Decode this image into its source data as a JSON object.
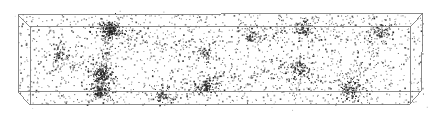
{
  "figure": {
    "title": "Cosmological simulation box particle distribution",
    "caption": "Perspective wireframe box containing scattered dark matter particles with dense clusters and filamentary structure",
    "background_color": "#ffffff",
    "width": 439,
    "height": 121
  },
  "box": {
    "name": "simulation-volume",
    "edge_color": "#6e6e6e",
    "edge_width": 0.8,
    "projection": "perspective",
    "face_fill": "none",
    "rear_face": {
      "label": "rear-face",
      "top_left": [
        18,
        15
      ],
      "top_right": [
        423,
        13
      ],
      "bottom_right": [
        421,
        91
      ],
      "bottom_left": [
        18,
        92
      ]
    },
    "front_face": {
      "label": "front-face",
      "top_left": [
        30,
        27
      ],
      "top_right": [
        411,
        26
      ],
      "bottom_right": [
        410,
        104
      ],
      "bottom_left": [
        30,
        105
      ]
    },
    "connector_edges": [
      "top-left-rear-to-front",
      "top-right-rear-to-front",
      "bottom-left-rear-to-front",
      "bottom-right-rear-to-front"
    ]
  },
  "chart_data": {
    "type": "scatter",
    "title": "",
    "xlabel": "",
    "ylabel": "",
    "xlim": [
      0,
      1
    ],
    "ylim": [
      0,
      1
    ],
    "grid": false,
    "legend": null,
    "point_count": 3400,
    "point_color": "#303030",
    "point_size_px": 1.1,
    "point_opacity": 0.85,
    "background": "#ffffff",
    "clusters": [
      {
        "name": "halo-1",
        "x": 110,
        "y": 29,
        "n": 230,
        "sigma": 11,
        "strength": 1.0
      },
      {
        "name": "halo-2",
        "x": 101,
        "y": 74,
        "n": 150,
        "sigma": 9,
        "strength": 0.85
      },
      {
        "name": "halo-3",
        "x": 100,
        "y": 92,
        "n": 120,
        "sigma": 8,
        "strength": 0.8
      },
      {
        "name": "halo-4",
        "x": 206,
        "y": 86,
        "n": 130,
        "sigma": 10,
        "strength": 0.8
      },
      {
        "name": "halo-5",
        "x": 299,
        "y": 68,
        "n": 110,
        "sigma": 11,
        "strength": 0.7
      },
      {
        "name": "halo-6",
        "x": 352,
        "y": 88,
        "n": 140,
        "sigma": 11,
        "strength": 0.8
      },
      {
        "name": "halo-7",
        "x": 303,
        "y": 28,
        "n": 90,
        "sigma": 9,
        "strength": 0.65
      },
      {
        "name": "halo-8",
        "x": 203,
        "y": 52,
        "n": 70,
        "sigma": 9,
        "strength": 0.5
      },
      {
        "name": "halo-9",
        "x": 380,
        "y": 33,
        "n": 80,
        "sigma": 10,
        "strength": 0.6
      },
      {
        "name": "halo-10",
        "x": 60,
        "y": 55,
        "n": 70,
        "sigma": 10,
        "strength": 0.5
      },
      {
        "name": "halo-11",
        "x": 250,
        "y": 35,
        "n": 60,
        "sigma": 9,
        "strength": 0.45
      },
      {
        "name": "halo-12",
        "x": 160,
        "y": 95,
        "n": 70,
        "sigma": 9,
        "strength": 0.5
      }
    ],
    "filaments": [
      {
        "name": "filament-1",
        "from": [
          110,
          30
        ],
        "to": [
          101,
          74
        ],
        "n": 110,
        "width": 4
      },
      {
        "name": "filament-2",
        "from": [
          101,
          74
        ],
        "to": [
          100,
          95
        ],
        "n": 80,
        "width": 4
      },
      {
        "name": "filament-3",
        "from": [
          110,
          30
        ],
        "to": [
          203,
          52
        ],
        "n": 70,
        "width": 5
      },
      {
        "name": "filament-4",
        "from": [
          206,
          86
        ],
        "to": [
          299,
          68
        ],
        "n": 70,
        "width": 5
      },
      {
        "name": "filament-5",
        "from": [
          299,
          68
        ],
        "to": [
          352,
          88
        ],
        "n": 60,
        "width": 5
      },
      {
        "name": "filament-6",
        "from": [
          303,
          28
        ],
        "to": [
          380,
          33
        ],
        "n": 55,
        "width": 5
      },
      {
        "name": "filament-7",
        "from": [
          160,
          95
        ],
        "to": [
          206,
          86
        ],
        "n": 50,
        "width": 5
      },
      {
        "name": "filament-8",
        "from": [
          250,
          35
        ],
        "to": [
          303,
          28
        ],
        "n": 45,
        "width": 5
      },
      {
        "name": "filament-9",
        "from": [
          60,
          55
        ],
        "to": [
          101,
          74
        ],
        "n": 45,
        "width": 5
      },
      {
        "name": "filament-10",
        "from": [
          352,
          88
        ],
        "to": [
          380,
          33
        ],
        "n": 50,
        "width": 6
      }
    ],
    "uniform_background_points": 1650,
    "random_seed": 20240517
  }
}
